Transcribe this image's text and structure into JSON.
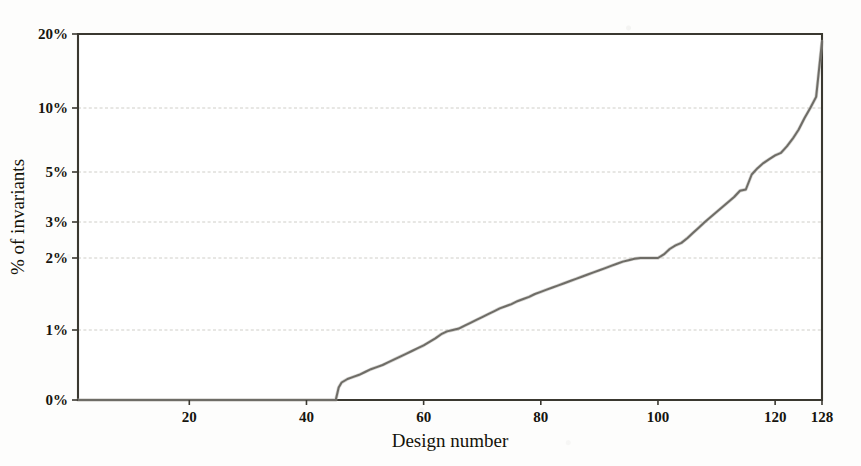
{
  "chart_data": {
    "type": "line",
    "title": "",
    "xlabel": "Design number",
    "ylabel": "% of invariants",
    "xlim": [
      1,
      128
    ],
    "ylim": [
      0,
      20
    ],
    "yscale": "custom-nonlinear",
    "grid": true,
    "legend": null,
    "xticks": [
      20,
      40,
      60,
      80,
      100,
      120,
      128
    ],
    "xtick_labels": [
      "20",
      "40",
      "60",
      "80",
      "100",
      "120",
      "128"
    ],
    "yticks": [
      0,
      1,
      2,
      3,
      5,
      10,
      20
    ],
    "ytick_labels": [
      "0%",
      "1%",
      "2%",
      "3%",
      "5%",
      "10%",
      "20%"
    ],
    "series": [
      {
        "name": "% of invariants",
        "x": [
          1,
          5,
          10,
          15,
          20,
          25,
          30,
          35,
          40,
          43,
          44,
          45,
          45.5,
          46,
          47,
          48,
          49,
          50,
          51,
          52,
          53,
          54,
          55,
          56,
          57,
          58,
          59,
          60,
          61,
          62,
          63,
          64,
          65,
          66,
          67,
          68,
          69,
          70,
          71,
          72,
          73,
          74,
          75,
          76,
          77,
          78,
          79,
          80,
          81,
          82,
          83,
          84,
          85,
          86,
          87,
          88,
          89,
          90,
          91,
          92,
          93,
          94,
          95,
          96,
          97,
          98,
          99,
          100,
          101,
          102,
          103,
          104,
          105,
          106,
          107,
          108,
          109,
          110,
          111,
          112,
          113,
          114,
          115,
          116,
          117,
          118,
          119,
          120,
          121,
          122,
          123,
          124,
          125,
          126,
          127,
          128
        ],
        "y": [
          0,
          0,
          0,
          0,
          0,
          0,
          0,
          0,
          0,
          0,
          0,
          0,
          0.18,
          0.25,
          0.3,
          0.33,
          0.36,
          0.4,
          0.44,
          0.47,
          0.5,
          0.54,
          0.58,
          0.62,
          0.66,
          0.7,
          0.74,
          0.78,
          0.83,
          0.88,
          0.94,
          0.98,
          1.0,
          1.02,
          1.06,
          1.1,
          1.14,
          1.18,
          1.22,
          1.26,
          1.3,
          1.33,
          1.36,
          1.4,
          1.43,
          1.46,
          1.5,
          1.53,
          1.56,
          1.59,
          1.62,
          1.65,
          1.68,
          1.71,
          1.74,
          1.77,
          1.8,
          1.83,
          1.86,
          1.89,
          1.92,
          1.95,
          1.97,
          1.99,
          2.0,
          2.0,
          2.0,
          2.0,
          2.1,
          2.25,
          2.35,
          2.42,
          2.55,
          2.7,
          2.85,
          3.0,
          3.2,
          3.4,
          3.6,
          3.8,
          4.0,
          4.25,
          4.3,
          4.9,
          5.3,
          5.7,
          6.0,
          6.3,
          6.5,
          7.0,
          7.6,
          8.3,
          9.2,
          10.0,
          11.5,
          19.0
        ]
      }
    ],
    "annotations": [
      "Curve is zero for designs 1-44",
      "Sharp jump at design 45",
      "Plateau at 2% around designs 97-100",
      "Steep final rise to ~19% at design 128"
    ]
  },
  "axes": {
    "y_axis_title": "% of invariants",
    "x_axis_title": "Design number"
  }
}
